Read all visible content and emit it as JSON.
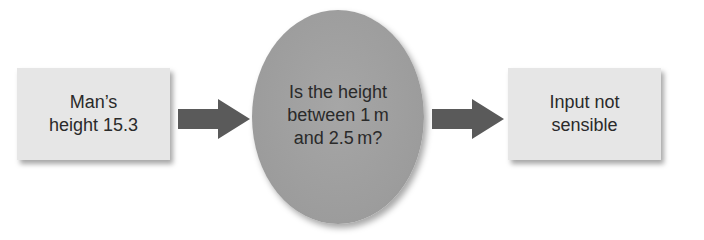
{
  "diagram": {
    "type": "flowchart",
    "nodes": [
      {
        "id": "input",
        "shape": "rectangle",
        "lines": [
          "Man’s",
          "height 15.3"
        ]
      },
      {
        "id": "decision",
        "shape": "ellipse",
        "lines": [
          "Is the height",
          "between 1 m",
          "and 2.5 m?"
        ]
      },
      {
        "id": "output",
        "shape": "rectangle",
        "lines": [
          "Input not",
          "sensible"
        ]
      }
    ],
    "edges": [
      {
        "from": "input",
        "to": "decision",
        "icon": "arrow-right-icon"
      },
      {
        "from": "decision",
        "to": "output",
        "icon": "arrow-right-icon"
      }
    ],
    "colors": {
      "box_fill": "#e6e6e6",
      "ellipse_fill": "#9e9e9e",
      "arrow_fill": "#5a5a5a",
      "text": "#2a2a2a"
    }
  }
}
